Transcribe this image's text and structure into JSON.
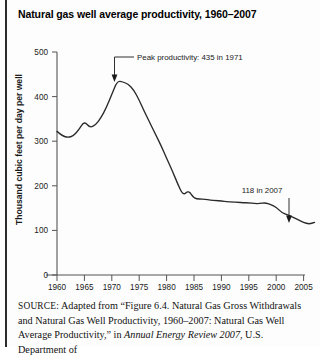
{
  "figure": {
    "title": "Natural gas well average productivity, 1960–2007"
  },
  "source": {
    "label": "SOURCE:",
    "text_before_italic": " Adapted from “Figure 6.4. Natural Gas Gross Withdrawals and Natural Gas Well Productivity, 1960–2007: Natural Gas Well Average Productivity,” in ",
    "italic_title": "Annual Energy Review 2007",
    "text_after_italic": ", U.S. Department of"
  },
  "chart_data": {
    "type": "line",
    "title": "Natural gas well average productivity, 1960–2007",
    "xlabel": "",
    "ylabel": "Thousand cubic feet per day per well",
    "xlim": [
      1960,
      2007
    ],
    "ylim": [
      0,
      500
    ],
    "ytick_labels": [
      "0",
      "100",
      "200",
      "300",
      "400",
      "500"
    ],
    "yticks": [
      0,
      100,
      200,
      300,
      400,
      500
    ],
    "xtick_labels": [
      "1960",
      "1965",
      "1970",
      "1975",
      "1980",
      "1985",
      "1990",
      "1995",
      "2000",
      "2005"
    ],
    "xticks": [
      1960,
      1965,
      1970,
      1975,
      1980,
      1985,
      1990,
      1995,
      2000,
      2005
    ],
    "grid": false,
    "legend": "none",
    "series": [
      {
        "name": "Natural gas well average productivity",
        "x": [
          1960,
          1961,
          1962,
          1963,
          1964,
          1965,
          1966,
          1967,
          1968,
          1969,
          1970,
          1971,
          1972,
          1973,
          1974,
          1975,
          1976,
          1977,
          1978,
          1979,
          1980,
          1981,
          1982,
          1983,
          1984,
          1985,
          1986,
          1987,
          1988,
          1989,
          1990,
          1991,
          1992,
          1993,
          1994,
          1995,
          1996,
          1997,
          1998,
          1999,
          2000,
          2001,
          2002,
          2003,
          2004,
          2005,
          2006,
          2007
        ],
        "values": [
          322,
          312,
          308,
          312,
          326,
          345,
          330,
          336,
          352,
          375,
          405,
          435,
          433,
          428,
          415,
          392,
          365,
          340,
          315,
          290,
          262,
          235,
          205,
          178,
          190,
          172,
          170,
          170,
          168,
          167,
          166,
          164,
          164,
          163,
          162,
          162,
          160,
          160,
          162,
          158,
          152,
          140,
          135,
          130,
          124,
          118,
          114,
          118
        ]
      }
    ],
    "annotations": [
      {
        "name": "peak-annotation",
        "text": "Peak productivity:  435 in 1971",
        "value": 435,
        "year": 1971
      },
      {
        "name": "end-annotation",
        "text": "118 in 2007",
        "value": 118,
        "year": 2007
      }
    ],
    "colors": {
      "line": "#2a2a2a",
      "axis": "#555555",
      "background": "#fdfdfd"
    }
  }
}
